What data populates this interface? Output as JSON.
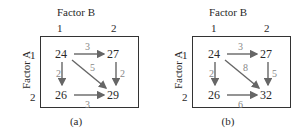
{
  "panels": [
    {
      "id": "a",
      "factor_b_label": "Factor B",
      "factor_a_label": "Factor A",
      "b_levels": [
        "1",
        "2"
      ],
      "a_levels": [
        "1",
        "2"
      ],
      "cells": {
        "a1b1": "24",
        "a1b2": "27",
        "a2b1": "26",
        "a2b2": "29"
      },
      "effects": {
        "top": "3",
        "left": "2",
        "right": "2",
        "bottom": "3",
        "diagonal": "5"
      },
      "caption": "(a)"
    },
    {
      "id": "b",
      "factor_b_label": "Factor B",
      "factor_a_label": "Factor A",
      "b_levels": [
        "1",
        "2"
      ],
      "a_levels": [
        "1",
        "2"
      ],
      "cells": {
        "a1b1": "24",
        "a1b2": "27",
        "a2b1": "26",
        "a2b2": "32"
      },
      "effects": {
        "top": "3",
        "left": "2",
        "right": "5",
        "bottom": "6",
        "diagonal": "8"
      },
      "caption": "(b)"
    }
  ],
  "colors": {
    "box": "#333333",
    "arrow": "#666666",
    "effect_text": "#888888",
    "text": "#2a2a2a"
  }
}
